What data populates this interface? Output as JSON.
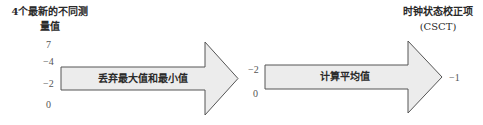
{
  "diagram": {
    "input_title_line1": "4个最新的不同测",
    "input_title_line2": "量值",
    "input_values": [
      "7",
      "−4",
      "−2",
      "0"
    ],
    "step1": {
      "label": "丢弃最大值和最小值",
      "shape": "right-arrow"
    },
    "intermediate_values": [
      "−2",
      "0"
    ],
    "step2": {
      "label": "计算平均值",
      "shape": "right-arrow"
    },
    "output_title_line1": "时钟状态校正项",
    "output_title_line2": "(CSCT)",
    "output_value": "−1",
    "colors": {
      "arrow_fill": "#ececec",
      "arrow_stroke": "#555555",
      "text": "#2a2a2a"
    }
  }
}
